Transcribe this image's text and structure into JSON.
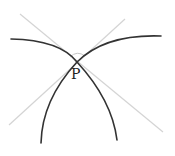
{
  "diagram": {
    "title": "",
    "point_label": "P",
    "colors": {
      "curve": "#333333",
      "tangent": "#d4d4d4",
      "angle_mark": "#c8c8c8",
      "label": "#222222",
      "background": "#ffffff"
    },
    "elements": [
      {
        "type": "arc",
        "name": "left-curve",
        "description": "Dark curve from upper-left through P descending to lower-right"
      },
      {
        "type": "arc",
        "name": "right-curve",
        "description": "Dark curve from upper-right through P descending to lower-left"
      },
      {
        "type": "line",
        "name": "tangent-line-1",
        "description": "Light tangent to left curve at P"
      },
      {
        "type": "line",
        "name": "tangent-line-2",
        "description": "Light tangent to right curve at P"
      },
      {
        "type": "arc",
        "name": "angle-mark",
        "description": "Small arc marking the angle between tangents above P"
      },
      {
        "type": "point",
        "name": "intersection-point",
        "label": "P"
      }
    ]
  }
}
